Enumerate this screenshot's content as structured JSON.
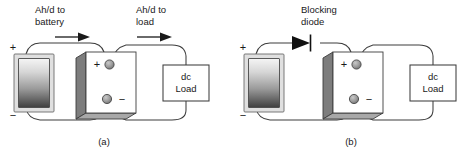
{
  "figure": {
    "colors": {
      "wire": "#3d3d3d",
      "text": "#1a1a1a",
      "panel_frame": "#d9d9d9",
      "panel_gradient_top": "#f2f2f2",
      "panel_gradient_bottom": "#4d4d4d",
      "battery_side": "#808080",
      "battery_front": "#ffffff",
      "battery_bottom": "#a6a6a6",
      "terminal_fill": "#9c9c9c",
      "diode_fill": "#111111"
    }
  },
  "panels": [
    {
      "caption": "(a)",
      "labels": [
        {
          "name": "flow-to-battery",
          "line1": "Ah/d to",
          "line2": "battery"
        },
        {
          "name": "flow-to-load",
          "line1": "Ah/d to",
          "line2": "load"
        }
      ],
      "pv_module": {
        "name": "pv-module",
        "plus": "+",
        "minus": "−"
      },
      "battery": {
        "name": "battery",
        "plus": "+",
        "minus": "−"
      },
      "load": {
        "name": "dc-load",
        "line1": "dc",
        "line2": "Load"
      },
      "arrows": [
        {
          "name": "current-arrow-to-battery"
        },
        {
          "name": "current-arrow-to-load"
        }
      ],
      "diode": null
    },
    {
      "caption": "(b)",
      "labels": [
        {
          "name": "blocking-diode-label",
          "line1": "Blocking",
          "line2": "diode"
        }
      ],
      "pv_module": {
        "name": "pv-module",
        "plus": "+",
        "minus": "−"
      },
      "battery": {
        "name": "battery",
        "plus": "+",
        "minus": "−"
      },
      "load": {
        "name": "dc-load",
        "line1": "dc",
        "line2": "Load"
      },
      "arrows": [],
      "diode": {
        "name": "blocking-diode"
      }
    }
  ]
}
